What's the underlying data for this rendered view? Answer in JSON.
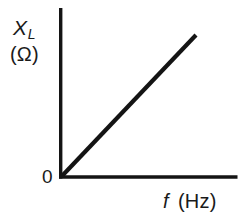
{
  "figure": {
    "background_color": "#ffffff",
    "ink_color": "#141414",
    "origin_label": "0"
  },
  "axes": {
    "y": {
      "symbol": "X",
      "subscript": "L",
      "unit": "(Ω)"
    },
    "x": {
      "symbol": "f",
      "unit": "(Hz)"
    }
  },
  "chart_data": {
    "type": "line",
    "title": "",
    "subtitle": "",
    "xlabel": "f (Hz)",
    "ylabel": "X_L (Ω)",
    "xlim": [
      0,
      1
    ],
    "ylim": [
      0,
      1
    ],
    "grid": false,
    "legend_position": "none",
    "xtick_labels": [
      "0"
    ],
    "ytick_labels": [],
    "annotations": [
      "0"
    ],
    "series": [
      {
        "name": "Inductive reactance",
        "color": "#141414",
        "x": [
          0,
          1
        ],
        "y": [
          0,
          1
        ],
        "relationship": "linear through origin, positive slope"
      }
    ]
  }
}
